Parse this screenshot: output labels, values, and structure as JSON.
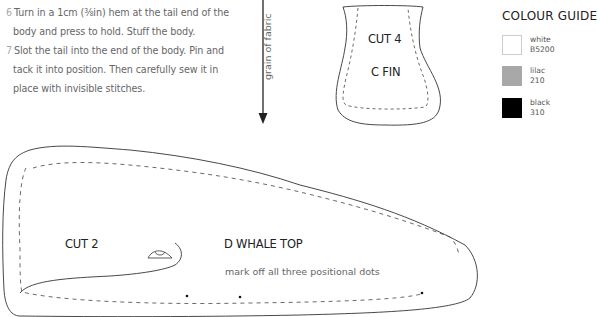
{
  "instructions": {
    "steps": [
      {
        "number": "6",
        "lines": [
          "Turn in a 1cm (⅜in) hem at the tail end of the",
          "body and press to hold. Stuff the body."
        ]
      },
      {
        "number": "7",
        "lines": [
          "Slot the tail into the end of the body. Pin and",
          "tack it into position. Then carefully sew it in",
          "place with invisible stitches."
        ]
      }
    ]
  },
  "grain": {
    "label": "grain of fabric",
    "icon": "down-arrow-icon"
  },
  "pieces": {
    "fin": {
      "cut": "CUT 4",
      "name": "C FIN"
    },
    "whale_top": {
      "cut": "CUT 2",
      "name": "D WHALE TOP",
      "note": "mark off all three positional dots"
    }
  },
  "colour_guide": {
    "title": "COLOUR GUIDE",
    "swatches": [
      {
        "name": "white",
        "code": "B5200",
        "color": "#ffffff"
      },
      {
        "name": "lilac",
        "code": "210",
        "color": "#a8a8a8"
      },
      {
        "name": "black",
        "code": "310",
        "color": "#000000"
      }
    ]
  }
}
